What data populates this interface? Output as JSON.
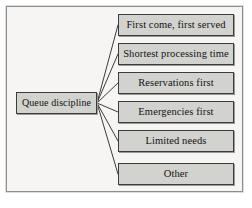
{
  "diagram": {
    "title": "Queue discipline",
    "root": {
      "label": "Queue discipline"
    },
    "options": [
      {
        "label": "First come, first served"
      },
      {
        "label": "Shortest processing time"
      },
      {
        "label": "Reservations first"
      },
      {
        "label": "Emergencies first"
      },
      {
        "label": "Limited needs"
      },
      {
        "label": "Other"
      }
    ],
    "colors": {
      "node_fill": "#d2d2cf",
      "node_border": "#3c3c3a",
      "frame_background": "#f6f5f3",
      "frame_border": "#8e8e8c",
      "connector": "#3c3c3a",
      "text": "#121212"
    }
  }
}
